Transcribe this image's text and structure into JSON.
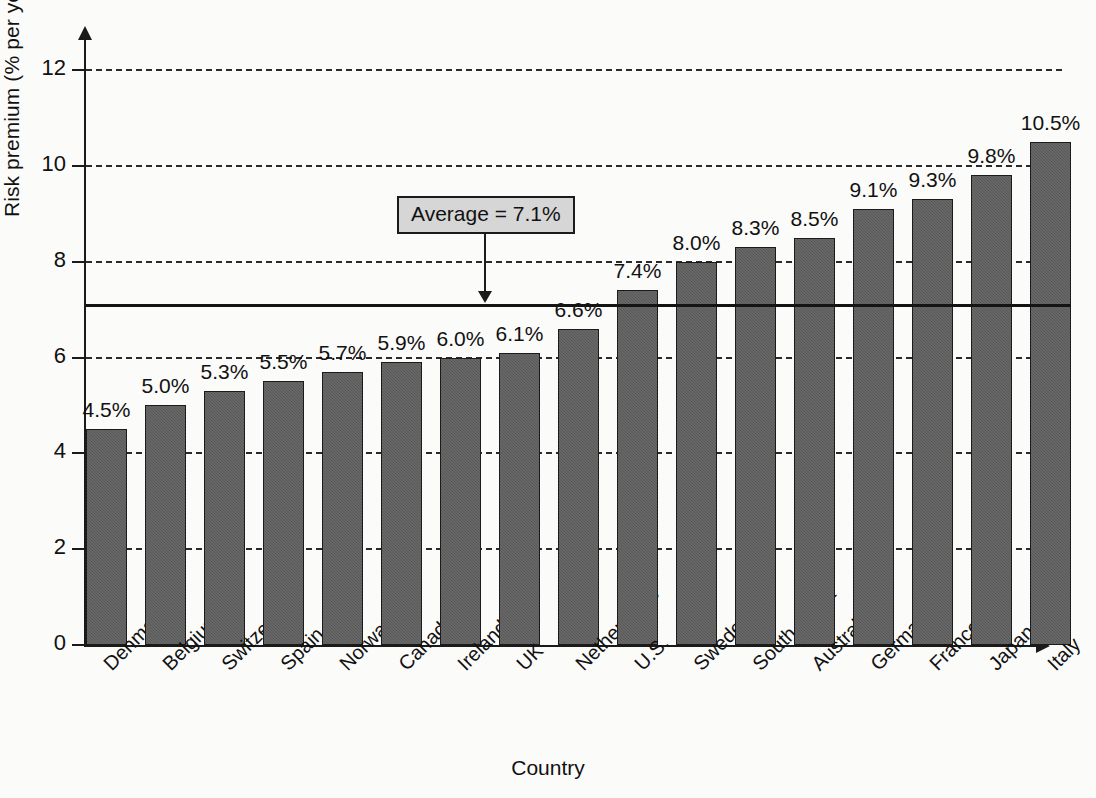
{
  "chart_data": {
    "type": "bar",
    "title": "",
    "xlabel": "Country",
    "ylabel": "Risk premium (% per year)",
    "ylim": [
      0,
      12
    ],
    "ytick_labels": [
      "0",
      "2",
      "4",
      "6",
      "8",
      "10",
      "12"
    ],
    "ytick_values": [
      0,
      2,
      4,
      6,
      8,
      10,
      12
    ],
    "grid": "horizontal-dashed",
    "legend": "none",
    "categories": [
      "Denmark",
      "Belgium",
      "Switzerland",
      "Spain",
      "Norway",
      "Canada",
      "Ireland",
      "UK",
      "Netherlands",
      "U.S.",
      "Sweden",
      "South Africa",
      "Australia",
      "Germany",
      "France",
      "Japan",
      "Italy"
    ],
    "values": [
      4.5,
      5.0,
      5.3,
      5.5,
      5.7,
      5.9,
      6.0,
      6.1,
      6.6,
      7.4,
      8.0,
      8.3,
      8.5,
      9.1,
      9.3,
      9.8,
      10.5
    ],
    "value_labels": [
      "4.5%",
      "5.0%",
      "5.3%",
      "5.5%",
      "5.7%",
      "5.9%",
      "6.0%",
      "6.1%",
      "6.6%",
      "7.4%",
      "8.0%",
      "8.3%",
      "8.5%",
      "9.1%",
      "9.3%",
      "9.8%",
      "10.5%"
    ],
    "annotations": [
      {
        "name": "average-line",
        "label": "Average = 7.1%",
        "value": 7.1,
        "kind": "horizontal-reference-line-with-callout"
      }
    ],
    "colors": {
      "bar_fill": "#585858",
      "bar_border": "#1b1b1b",
      "axis": "#1a1a1a",
      "gridline": "#2a2a2a",
      "callout_background": "#d6d6d6",
      "text": "#111111",
      "page_background": "#fbfbfa"
    }
  }
}
